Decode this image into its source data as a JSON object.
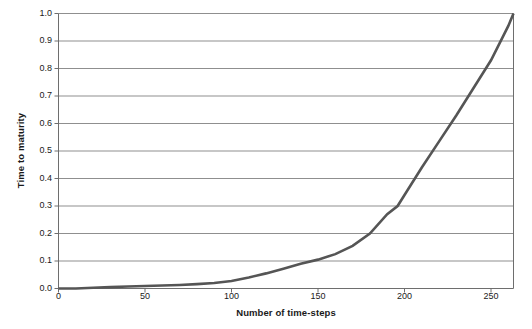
{
  "chart_data": {
    "type": "line",
    "title": "",
    "xlabel": "Number of time-steps",
    "ylabel": "Time to maturity",
    "xlim": [
      0,
      263
    ],
    "ylim": [
      0,
      1.0
    ],
    "grid": true,
    "legend": null,
    "x_ticks": [
      0,
      50,
      100,
      150,
      200,
      250
    ],
    "x_tick_labels": [
      "0",
      "50",
      "100",
      "150",
      "200",
      "250"
    ],
    "y_ticks": [
      0.0,
      0.1,
      0.2,
      0.3,
      0.4,
      0.5,
      0.6,
      0.7,
      0.8,
      0.9,
      1.0
    ],
    "y_tick_labels": [
      "0.0",
      "0.1",
      "0.2",
      "0.3",
      "0.4",
      "0.5",
      "0.6",
      "0.7",
      "0.8",
      "0.9",
      "1.0"
    ],
    "series": [
      {
        "name": "Time to maturity",
        "color": "#555555",
        "x": [
          0,
          10,
          20,
          30,
          40,
          50,
          60,
          70,
          80,
          90,
          100,
          110,
          120,
          130,
          140,
          150,
          160,
          170,
          180,
          190,
          196,
          200,
          210,
          220,
          230,
          240,
          250,
          260,
          263
        ],
        "values": [
          0.0,
          0.0,
          0.003,
          0.005,
          0.007,
          0.009,
          0.011,
          0.013,
          0.016,
          0.02,
          0.027,
          0.04,
          0.055,
          0.072,
          0.09,
          0.105,
          0.125,
          0.155,
          0.2,
          0.27,
          0.3,
          0.34,
          0.44,
          0.535,
          0.63,
          0.73,
          0.83,
          0.955,
          1.0
        ]
      }
    ]
  },
  "axes": {
    "grid_color": "#8f8f8f",
    "frame_color": "#6e6e6e",
    "background": "#ffffff"
  }
}
